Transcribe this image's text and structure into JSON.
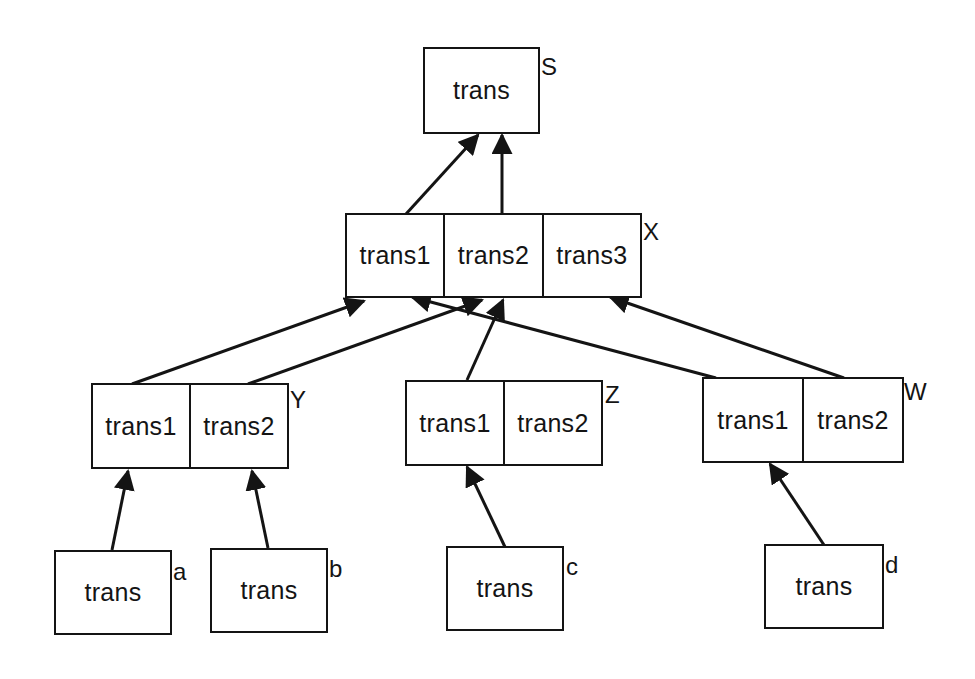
{
  "diagram": {
    "type": "tree",
    "direction": "bottom-up",
    "colors": {
      "line": "#141414",
      "background": "#ffffff"
    },
    "nodes": {
      "S": {
        "label": "S",
        "cells": [
          "trans"
        ]
      },
      "X": {
        "label": "X",
        "cells": [
          "trans1",
          "trans2",
          "trans3"
        ]
      },
      "Y": {
        "label": "Y",
        "cells": [
          "trans1",
          "trans2"
        ]
      },
      "Z": {
        "label": "Z",
        "cells": [
          "trans1",
          "trans2"
        ]
      },
      "W": {
        "label": "W",
        "cells": [
          "trans1",
          "trans2"
        ]
      },
      "a": {
        "label": "a",
        "cells": [
          "trans"
        ]
      },
      "b": {
        "label": "b",
        "cells": [
          "trans"
        ]
      },
      "c": {
        "label": "c",
        "cells": [
          "trans"
        ]
      },
      "d": {
        "label": "d",
        "cells": [
          "trans"
        ]
      }
    },
    "edges": [
      {
        "from": "X.trans1",
        "to": "S.trans"
      },
      {
        "from": "X.trans2",
        "to": "S.trans"
      },
      {
        "from": "Y.trans1",
        "to": "X.trans1"
      },
      {
        "from": "Y.trans2",
        "to": "X.trans2"
      },
      {
        "from": "Z.trans1",
        "to": "X.trans2"
      },
      {
        "from": "W.trans1",
        "to": "X.trans1"
      },
      {
        "from": "W.trans2",
        "to": "X.trans3"
      },
      {
        "from": "a.trans",
        "to": "Y.trans1"
      },
      {
        "from": "b.trans",
        "to": "Y.trans2"
      },
      {
        "from": "c.trans",
        "to": "Z.trans1"
      },
      {
        "from": "d.trans",
        "to": "W.trans1"
      }
    ]
  }
}
